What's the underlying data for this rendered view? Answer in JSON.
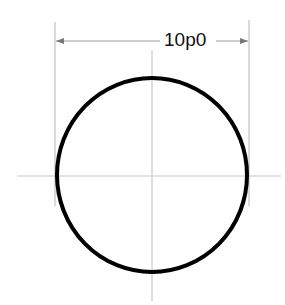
{
  "drawing": {
    "title": "circle-diameter-dimension",
    "dimension": {
      "label": "10p0",
      "type": "horizontal-diameter"
    },
    "colors": {
      "background": "#ffffff",
      "circle_stroke": "#000000",
      "centerline": "#c8c8c8",
      "dimension_line": "#9a9a9a",
      "label_text": "#111111"
    },
    "circle": {
      "cx": 152,
      "cy": 175,
      "rx": 95,
      "ry": 97,
      "stroke_width": 4
    }
  }
}
